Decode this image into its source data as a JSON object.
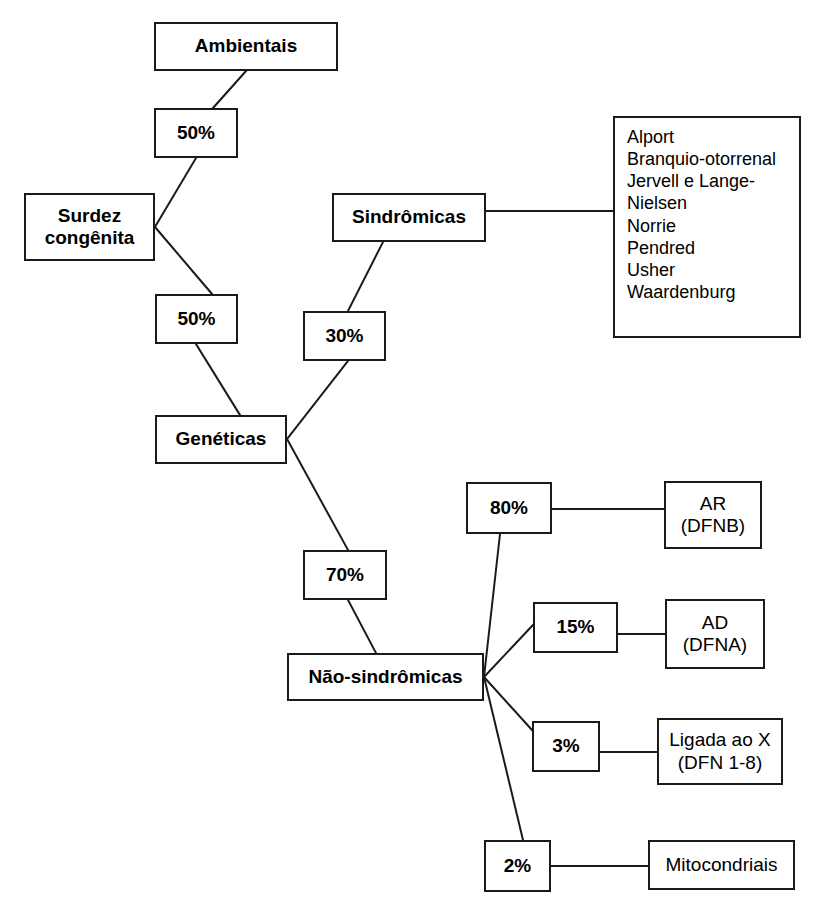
{
  "canvas": {
    "width": 820,
    "height": 911,
    "background": "#ffffff",
    "stroke": "#1a1a1a",
    "text_color": "#000000"
  },
  "title": "Surdez congênita",
  "nodes": [
    {
      "id": "ambientais",
      "name": "node-ambientais",
      "label": "Ambientais",
      "kind": "category",
      "weight": "bold",
      "font_size": 19,
      "x": 154,
      "y": 22,
      "w": 184,
      "h": 49
    },
    {
      "id": "pct-ambientais",
      "name": "node-percent-ambientais",
      "label": "50%",
      "kind": "percent",
      "weight": "bold",
      "font_size": 19,
      "x": 154,
      "y": 108,
      "w": 84,
      "h": 50
    },
    {
      "id": "surdez",
      "name": "node-surdez-congenita",
      "label": "Surdez\ncongênita",
      "kind": "root",
      "weight": "bold",
      "font_size": 19,
      "x": 24,
      "y": 193,
      "w": 131,
      "h": 68
    },
    {
      "id": "pct-geneticas",
      "name": "node-percent-geneticas",
      "label": "50%",
      "kind": "percent",
      "weight": "bold",
      "font_size": 19,
      "x": 155,
      "y": 294,
      "w": 83,
      "h": 50
    },
    {
      "id": "sindromicas",
      "name": "node-sindromicas",
      "label": "Sindrômicas",
      "kind": "category",
      "weight": "bold",
      "font_size": 19,
      "x": 332,
      "y": 193,
      "w": 154,
      "h": 49
    },
    {
      "id": "pct-sindromicas",
      "name": "node-percent-sindromicas",
      "label": "30%",
      "kind": "percent",
      "weight": "bold",
      "font_size": 19,
      "x": 303,
      "y": 311,
      "w": 83,
      "h": 50
    },
    {
      "id": "geneticas",
      "name": "node-geneticas",
      "label": "Genéticas",
      "kind": "category",
      "weight": "bold",
      "font_size": 19,
      "x": 155,
      "y": 415,
      "w": 132,
      "h": 49
    },
    {
      "id": "pct-nao-sindromicas",
      "name": "node-percent-nao-sindromicas",
      "label": "70%",
      "kind": "percent",
      "weight": "bold",
      "font_size": 19,
      "x": 303,
      "y": 550,
      "w": 84,
      "h": 50
    },
    {
      "id": "nao-sindromicas",
      "name": "node-nao-sindromicas",
      "label": "Não-sindrômicas",
      "kind": "category",
      "weight": "bold",
      "font_size": 19,
      "x": 287,
      "y": 653,
      "w": 197,
      "h": 48
    },
    {
      "id": "syndrome-list",
      "name": "node-syndrome-list",
      "label": "Alport\nBranquio-otorrenal\nJervell e Lange-\n  Nielsen\nNorrie\nPendred\nUsher\nWaardenburg",
      "kind": "list",
      "weight": "regular",
      "font_size": 18,
      "x": 613,
      "y": 116,
      "w": 188,
      "h": 222
    },
    {
      "id": "pct-ar",
      "name": "node-percent-ar",
      "label": "80%",
      "kind": "percent",
      "weight": "bold",
      "font_size": 19,
      "x": 466,
      "y": 482,
      "w": 86,
      "h": 52
    },
    {
      "id": "ar",
      "name": "node-ar-dfnb",
      "label": "AR\n(DFNB)",
      "kind": "leaf",
      "weight": "regular",
      "font_size": 19,
      "x": 664,
      "y": 481,
      "w": 98,
      "h": 68
    },
    {
      "id": "pct-ad",
      "name": "node-percent-ad",
      "label": "15%",
      "kind": "percent",
      "weight": "bold",
      "font_size": 19,
      "x": 533,
      "y": 602,
      "w": 85,
      "h": 51
    },
    {
      "id": "ad",
      "name": "node-ad-dfna",
      "label": "AD\n(DFNA)",
      "kind": "leaf",
      "weight": "regular",
      "font_size": 19,
      "x": 665,
      "y": 599,
      "w": 100,
      "h": 70
    },
    {
      "id": "pct-x",
      "name": "node-percent-ligada-ao-x",
      "label": "3%",
      "kind": "percent",
      "weight": "bold",
      "font_size": 19,
      "x": 532,
      "y": 721,
      "w": 68,
      "h": 51
    },
    {
      "id": "ligada-x",
      "name": "node-ligada-ao-x",
      "label": "Ligada ao X\n(DFN 1-8)",
      "kind": "leaf",
      "weight": "regular",
      "font_size": 19,
      "x": 657,
      "y": 718,
      "w": 126,
      "h": 67
    },
    {
      "id": "pct-mito",
      "name": "node-percent-mitocondriais",
      "label": "2%",
      "kind": "percent",
      "weight": "bold",
      "font_size": 19,
      "x": 484,
      "y": 840,
      "w": 67,
      "h": 52
    },
    {
      "id": "mitocondriais",
      "name": "node-mitocondriais",
      "label": "Mitocondriais",
      "kind": "leaf",
      "weight": "regular",
      "font_size": 19,
      "x": 648,
      "y": 840,
      "w": 147,
      "h": 50
    }
  ],
  "edges": [
    {
      "name": "edge-ambientais-to-50",
      "from": "ambientais",
      "to": "pct-ambientais",
      "x1": 246,
      "y1": 71,
      "x2": 213,
      "y2": 108
    },
    {
      "name": "edge-50-to-surdez",
      "from": "pct-ambientais",
      "to": "surdez",
      "x1": 196,
      "y1": 158,
      "x2": 155,
      "y2": 227
    },
    {
      "name": "edge-surdez-to-50",
      "from": "surdez",
      "to": "pct-geneticas",
      "x1": 155,
      "y1": 227,
      "x2": 212,
      "y2": 294
    },
    {
      "name": "edge-50-to-geneticas",
      "from": "pct-geneticas",
      "to": "geneticas",
      "x1": 196,
      "y1": 344,
      "x2": 240,
      "y2": 415
    },
    {
      "name": "edge-geneticas-to-30",
      "from": "geneticas",
      "to": "pct-sindromicas",
      "x1": 287,
      "y1": 439,
      "x2": 348,
      "y2": 361
    },
    {
      "name": "edge-30-to-sindromicas",
      "from": "pct-sindromicas",
      "to": "sindromicas",
      "x1": 348,
      "y1": 311,
      "x2": 383,
      "y2": 242
    },
    {
      "name": "edge-sindromicas-to-list",
      "from": "sindromicas",
      "to": "syndrome-list",
      "x1": 486,
      "y1": 211,
      "x2": 613,
      "y2": 211
    },
    {
      "name": "edge-geneticas-to-70",
      "from": "geneticas",
      "to": "pct-nao-sindromicas",
      "x1": 287,
      "y1": 439,
      "x2": 348,
      "y2": 550
    },
    {
      "name": "edge-70-to-nao-sindromicas",
      "from": "pct-nao-sindromicas",
      "to": "nao-sindromicas",
      "x1": 348,
      "y1": 600,
      "x2": 376,
      "y2": 653
    },
    {
      "name": "edge-nao-sindromicas-to-80",
      "from": "nao-sindromicas",
      "to": "pct-ar",
      "x1": 484,
      "y1": 677,
      "x2": 500,
      "y2": 534
    },
    {
      "name": "edge-80-to-ar",
      "from": "pct-ar",
      "to": "ar",
      "x1": 552,
      "y1": 509,
      "x2": 664,
      "y2": 509
    },
    {
      "name": "edge-nao-sindromicas-to-15",
      "from": "nao-sindromicas",
      "to": "pct-ad",
      "x1": 484,
      "y1": 677,
      "x2": 533,
      "y2": 625
    },
    {
      "name": "edge-15-to-ad",
      "from": "pct-ad",
      "to": "ad",
      "x1": 618,
      "y1": 634,
      "x2": 665,
      "y2": 634
    },
    {
      "name": "edge-nao-sindromicas-to-3",
      "from": "nao-sindromicas",
      "to": "pct-x",
      "x1": 484,
      "y1": 677,
      "x2": 532,
      "y2": 730
    },
    {
      "name": "edge-3-to-ligada-x",
      "from": "pct-x",
      "to": "ligada-x",
      "x1": 600,
      "y1": 752,
      "x2": 657,
      "y2": 752
    },
    {
      "name": "edge-nao-sindromicas-to-2",
      "from": "nao-sindromicas",
      "to": "pct-mito",
      "x1": 484,
      "y1": 677,
      "x2": 523,
      "y2": 840
    },
    {
      "name": "edge-2-to-mitocondriais",
      "from": "pct-mito",
      "to": "mitocondriais",
      "x1": 551,
      "y1": 866,
      "x2": 648,
      "y2": 866
    }
  ]
}
